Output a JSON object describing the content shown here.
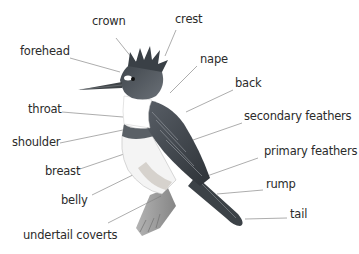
{
  "diagram": {
    "colors": {
      "line": "#8a8a8a",
      "text": "#2b2b2b",
      "background": "#ffffff"
    },
    "labels": [
      {
        "id": "crown",
        "text": "crown",
        "x": 92,
        "y": 16
      },
      {
        "id": "crest",
        "text": "crest",
        "x": 175,
        "y": 14
      },
      {
        "id": "forehead",
        "text": "forehead",
        "x": 20,
        "y": 46
      },
      {
        "id": "nape",
        "text": "nape",
        "x": 200,
        "y": 54
      },
      {
        "id": "back",
        "text": "back",
        "x": 235,
        "y": 78
      },
      {
        "id": "throat",
        "text": "throat",
        "x": 28,
        "y": 104
      },
      {
        "id": "secondary-feathers",
        "text": "secondary feathers",
        "x": 244,
        "y": 111
      },
      {
        "id": "shoulder",
        "text": "shoulder",
        "x": 12,
        "y": 137
      },
      {
        "id": "primary-feathers",
        "text": "primary feathers",
        "x": 264,
        "y": 146
      },
      {
        "id": "breast",
        "text": "breast",
        "x": 45,
        "y": 166
      },
      {
        "id": "rump",
        "text": "rump",
        "x": 266,
        "y": 179
      },
      {
        "id": "belly",
        "text": "belly",
        "x": 61,
        "y": 195
      },
      {
        "id": "tail",
        "text": "tail",
        "x": 290,
        "y": 209
      },
      {
        "id": "undertail-coverts",
        "text": "undertail coverts",
        "x": 23,
        "y": 230
      }
    ]
  }
}
